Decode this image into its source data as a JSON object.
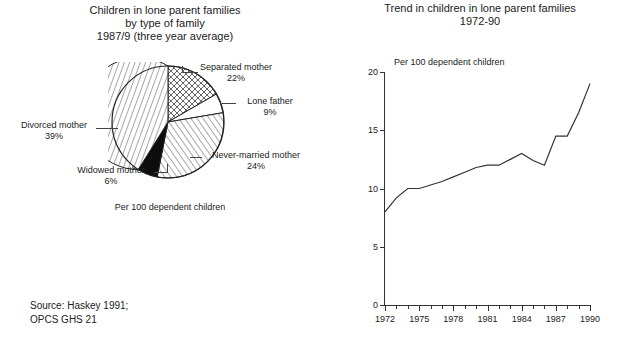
{
  "figure": {
    "left_chart": {
      "title": "Children in lone parent families\nby type of family\n1987/9 (three year average)",
      "caption": "Per 100 dependent children",
      "labels": {
        "separated": "Separated mother\n22%",
        "lone_father": "Lone father\n9%",
        "never_married": "Never-married mother\n24%",
        "widowed": "Widowed mother\n6%",
        "divorced": "Divorced mother\n39%"
      }
    },
    "right_chart": {
      "title": "Trend in children in lone parent families\n1972-90",
      "axis_note": "Per 100 dependent children"
    },
    "source": "Source: Haskey 1991;\nOPCS GHS 21"
  },
  "chart_data": [
    {
      "type": "pie",
      "title": "Children in lone parent families by type of family 1987/9 (three year average)",
      "subtitle": "Per 100 dependent children",
      "unit": "%",
      "labels": [
        "Separated mother",
        "Lone father",
        "Never-married mother",
        "Widowed mother",
        "Divorced mother"
      ],
      "values": [
        22,
        9,
        24,
        6,
        39
      ],
      "slice_fills": [
        "cross-hatch",
        "white",
        "diagonal-hatch",
        "solid-black",
        "vertical-hatch"
      ],
      "legend": "callout-labels",
      "grid": false
    },
    {
      "type": "line",
      "title": "Trend in children in lone parent families 1972-90",
      "xlabel": "",
      "ylabel": "Per 100 dependent children",
      "xlim": [
        1972,
        1990
      ],
      "ylim": [
        0,
        20
      ],
      "yticks": [
        0,
        5,
        10,
        15,
        20
      ],
      "xticks": [
        1972,
        1975,
        1978,
        1981,
        1984,
        1987,
        1990
      ],
      "minor_xticks_every": 1,
      "grid": false,
      "legend": "none",
      "x": [
        1972,
        1973,
        1974,
        1975,
        1976,
        1977,
        1978,
        1979,
        1980,
        1981,
        1982,
        1983,
        1984,
        1985,
        1986,
        1987,
        1988,
        1989,
        1990
      ],
      "values": [
        8.0,
        9.2,
        10.0,
        10.0,
        10.3,
        10.6,
        11.0,
        11.4,
        11.8,
        12.0,
        12.0,
        12.5,
        13.0,
        12.4,
        12.0,
        14.5,
        14.5,
        16.5,
        19.0
      ],
      "series": [
        {
          "name": "Children in lone parent families per 100 dependent children",
          "values": [
            8.0,
            9.2,
            10.0,
            10.0,
            10.3,
            10.6,
            11.0,
            11.4,
            11.8,
            12.0,
            12.0,
            12.5,
            13.0,
            12.4,
            12.0,
            14.5,
            14.5,
            16.5,
            19.0
          ]
        }
      ]
    }
  ]
}
